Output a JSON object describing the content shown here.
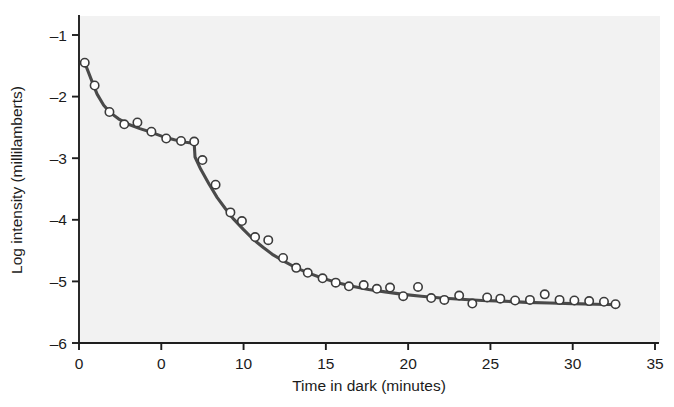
{
  "chart_data": {
    "type": "scatter",
    "title": "",
    "subtitle": "",
    "xlabel": "Time in dark (minutes)",
    "ylabel": "Log intensity (millilamberts)",
    "xlim": [
      0,
      35
    ],
    "ylim": [
      -6,
      -0.6
    ],
    "xticks": [
      0,
      5,
      10,
      15,
      20,
      25,
      30,
      35
    ],
    "xticklabels": [
      "0",
      "0",
      "10",
      "15",
      "20",
      "25",
      "30",
      "35"
    ],
    "yticks": [
      -1,
      -2,
      -3,
      -4,
      -5,
      -6
    ],
    "yticklabels": [
      "–1",
      "–2",
      "–3",
      "–4",
      "–5",
      "–6"
    ],
    "grid": false,
    "legend": null,
    "plot_background": "#f2f2f2",
    "marker": "open-circle",
    "marker_color": "#ffffff",
    "marker_edge_color": "#3c3c3c",
    "line_color": "#4a4a4a",
    "annotations": [
      {
        "label": "rod-cone break",
        "x": 7.0,
        "y": -2.78
      }
    ],
    "series": [
      {
        "name": "Threshold measurements",
        "marker_only": true,
        "points": [
          {
            "x": 0.35,
            "y": -1.45
          },
          {
            "x": 0.95,
            "y": -1.82
          },
          {
            "x": 1.85,
            "y": -2.25
          },
          {
            "x": 2.75,
            "y": -2.45
          },
          {
            "x": 3.55,
            "y": -2.42
          },
          {
            "x": 4.4,
            "y": -2.57
          },
          {
            "x": 5.3,
            "y": -2.68
          },
          {
            "x": 6.2,
            "y": -2.72
          },
          {
            "x": 7.0,
            "y": -2.73
          },
          {
            "x": 7.5,
            "y": -3.03
          },
          {
            "x": 8.3,
            "y": -3.43
          },
          {
            "x": 9.2,
            "y": -3.88
          },
          {
            "x": 9.9,
            "y": -4.02
          },
          {
            "x": 10.7,
            "y": -4.28
          },
          {
            "x": 11.5,
            "y": -4.33
          },
          {
            "x": 12.4,
            "y": -4.62
          },
          {
            "x": 13.2,
            "y": -4.78
          },
          {
            "x": 13.9,
            "y": -4.86
          },
          {
            "x": 14.8,
            "y": -4.95
          },
          {
            "x": 15.6,
            "y": -5.02
          },
          {
            "x": 16.4,
            "y": -5.08
          },
          {
            "x": 17.3,
            "y": -5.06
          },
          {
            "x": 18.1,
            "y": -5.12
          },
          {
            "x": 18.9,
            "y": -5.1
          },
          {
            "x": 19.7,
            "y": -5.24
          },
          {
            "x": 20.6,
            "y": -5.09
          },
          {
            "x": 21.4,
            "y": -5.27
          },
          {
            "x": 22.2,
            "y": -5.3
          },
          {
            "x": 23.1,
            "y": -5.23
          },
          {
            "x": 23.9,
            "y": -5.36
          },
          {
            "x": 24.8,
            "y": -5.26
          },
          {
            "x": 25.6,
            "y": -5.28
          },
          {
            "x": 26.5,
            "y": -5.31
          },
          {
            "x": 27.4,
            "y": -5.3
          },
          {
            "x": 28.3,
            "y": -5.21
          },
          {
            "x": 29.2,
            "y": -5.3
          },
          {
            "x": 30.1,
            "y": -5.31
          },
          {
            "x": 31.0,
            "y": -5.32
          },
          {
            "x": 31.9,
            "y": -5.33
          },
          {
            "x": 32.6,
            "y": -5.37
          }
        ]
      },
      {
        "name": "Fitted dark adaptation curve",
        "line_only": true,
        "points": [
          {
            "x": 0.35,
            "y": -1.45
          },
          {
            "x": 0.8,
            "y": -1.76
          },
          {
            "x": 1.1,
            "y": -1.96
          },
          {
            "x": 1.5,
            "y": -2.14
          },
          {
            "x": 1.9,
            "y": -2.26
          },
          {
            "x": 2.4,
            "y": -2.36
          },
          {
            "x": 3.0,
            "y": -2.45
          },
          {
            "x": 3.7,
            "y": -2.52
          },
          {
            "x": 4.4,
            "y": -2.58
          },
          {
            "x": 5.1,
            "y": -2.65
          },
          {
            "x": 5.8,
            "y": -2.7
          },
          {
            "x": 6.5,
            "y": -2.74
          },
          {
            "x": 7.0,
            "y": -2.76
          },
          {
            "x": 7.05,
            "y": -2.98
          },
          {
            "x": 7.4,
            "y": -3.18
          },
          {
            "x": 7.9,
            "y": -3.42
          },
          {
            "x": 8.4,
            "y": -3.64
          },
          {
            "x": 8.9,
            "y": -3.82
          },
          {
            "x": 9.4,
            "y": -3.99
          },
          {
            "x": 10.0,
            "y": -4.16
          },
          {
            "x": 10.6,
            "y": -4.32
          },
          {
            "x": 11.2,
            "y": -4.45
          },
          {
            "x": 11.8,
            "y": -4.57
          },
          {
            "x": 12.5,
            "y": -4.68
          },
          {
            "x": 13.2,
            "y": -4.78
          },
          {
            "x": 14.0,
            "y": -4.87
          },
          {
            "x": 14.8,
            "y": -4.95
          },
          {
            "x": 15.7,
            "y": -5.02
          },
          {
            "x": 16.6,
            "y": -5.08
          },
          {
            "x": 17.6,
            "y": -5.13
          },
          {
            "x": 18.6,
            "y": -5.17
          },
          {
            "x": 19.7,
            "y": -5.21
          },
          {
            "x": 20.8,
            "y": -5.24
          },
          {
            "x": 22.0,
            "y": -5.27
          },
          {
            "x": 23.2,
            "y": -5.29
          },
          {
            "x": 24.5,
            "y": -5.31
          },
          {
            "x": 25.8,
            "y": -5.32
          },
          {
            "x": 27.2,
            "y": -5.34
          },
          {
            "x": 28.6,
            "y": -5.35
          },
          {
            "x": 30.0,
            "y": -5.36
          },
          {
            "x": 31.4,
            "y": -5.37
          },
          {
            "x": 32.8,
            "y": -5.38
          }
        ]
      }
    ]
  },
  "axes": {
    "y_axis_name": "Log intensity (millilamberts)",
    "x_axis_name": "Time in dark (minutes)"
  }
}
